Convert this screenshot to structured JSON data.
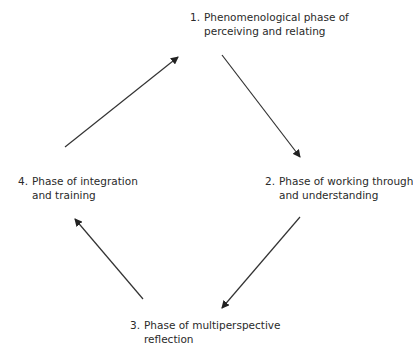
{
  "diagram": {
    "type": "cycle",
    "nodes": [
      {
        "id": 1,
        "number": "1.",
        "line1": "Phenomenological phase of",
        "line2": "perceiving and relating"
      },
      {
        "id": 2,
        "number": "2.",
        "line1": "Phase of working through",
        "line2": "and understanding"
      },
      {
        "id": 3,
        "number": "3.",
        "line1": "Phase of multiperspective",
        "line2": "reflection"
      },
      {
        "id": 4,
        "number": "4.",
        "line1": "Phase of integration",
        "line2": "and training"
      }
    ],
    "edges": [
      {
        "from": 1,
        "to": 2
      },
      {
        "from": 2,
        "to": 3
      },
      {
        "from": 3,
        "to": 4
      },
      {
        "from": 4,
        "to": 1
      }
    ],
    "colors": {
      "text": "#2a2a2a",
      "arrow": "#333333",
      "background": "#ffffff"
    }
  }
}
